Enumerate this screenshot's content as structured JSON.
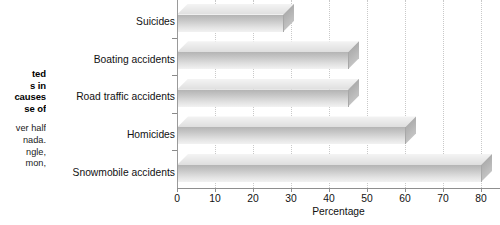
{
  "caption": {
    "title_lines": [
      "ted",
      "s in",
      "causes",
      "se of"
    ],
    "body_lines": [
      "ver half",
      "nada.",
      "ngle,",
      "mon,"
    ]
  },
  "chart_data": {
    "type": "bar",
    "orientation": "horizontal",
    "title": "",
    "xlabel": "Percentage",
    "ylabel": "",
    "categories": [
      "Suicides",
      "Boating accidents",
      "Road traffic accidents",
      "Homicides",
      "Snowmobile accidents"
    ],
    "values": [
      28,
      45,
      45,
      60,
      80
    ],
    "xlim": [
      0,
      85
    ],
    "xticks": [
      0,
      10,
      20,
      30,
      40,
      50,
      60,
      70,
      80
    ],
    "xtick_labels": [
      "0",
      "10",
      "20",
      "30",
      "40",
      "50",
      "60",
      "70",
      "80"
    ],
    "grid": true,
    "grid_axis": "x",
    "grid_style": "dotted",
    "legend": "none",
    "style": "3d",
    "colors": {
      "bar_front_dark": "#b4b4b4",
      "bar_front_light": "#f2f2f2",
      "bar_top": "#e8e8e8",
      "gridline": "#c9c9c9",
      "axis": "#8f8f8f",
      "text": "#111111",
      "background": "#ffffff"
    }
  }
}
